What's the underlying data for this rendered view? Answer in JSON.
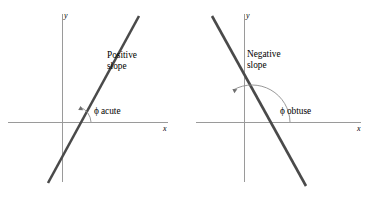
{
  "figure": {
    "background_color": "#ffffff",
    "axis_color": "#9a9a9a",
    "line_color": "#4a4a4a",
    "arc_color": "#8c8c8c",
    "text_color": "#3f3f3f",
    "axis_label_color": "#6a6a6a"
  },
  "panels": [
    {
      "id": "positive-slope",
      "slope_label_line1": "Positive",
      "slope_label_line2": "slope",
      "angle_symbol": "ϕ",
      "angle_description": "acute",
      "x_axis_label": "x",
      "y_axis_label": "y",
      "origin": {
        "x": 62,
        "y": 122
      },
      "x_axis": {
        "x1": 8,
        "y1": 122,
        "x2": 168,
        "y2": 122
      },
      "y_axis": {
        "x1": 62,
        "y1": 14,
        "x2": 62,
        "y2": 182
      },
      "line": {
        "x1": 48,
        "y1": 183,
        "x2": 139,
        "y2": 16
      },
      "arc": {
        "cx": 74,
        "cy": 122,
        "radius": 17,
        "start_deg": 0,
        "end_deg": 61
      }
    },
    {
      "id": "negative-slope",
      "slope_label_line1": "Negative",
      "slope_label_line2": "slope",
      "angle_symbol": "ϕ",
      "angle_description": "obtuse",
      "x_axis_label": "x",
      "y_axis_label": "y",
      "origin": {
        "x": 244,
        "y": 122
      },
      "x_axis": {
        "x1": 196,
        "y1": 122,
        "x2": 361,
        "y2": 122
      },
      "y_axis": {
        "x1": 244,
        "y1": 14,
        "x2": 244,
        "y2": 182
      },
      "line": {
        "x1": 212,
        "y1": 16,
        "x2": 306,
        "y2": 186
      },
      "arc": {
        "cx": 252,
        "cy": 122,
        "radius": 38,
        "start_deg": 0,
        "end_deg": 119
      }
    }
  ]
}
